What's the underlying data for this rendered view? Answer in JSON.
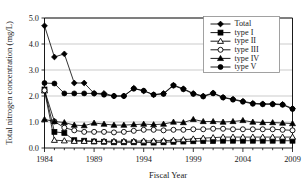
{
  "chart_data": {
    "type": "line",
    "title": "",
    "xlabel": "Fiscal Year",
    "ylabel": "Total nitrogen concentration (mg/L)",
    "xlim": [
      1984,
      2009
    ],
    "ylim": [
      0.0,
      5.0
    ],
    "grid": true,
    "legend_position": "top-right",
    "x": [
      1984,
      1985,
      1986,
      1987,
      1988,
      1989,
      1990,
      1991,
      1992,
      1993,
      1994,
      1995,
      1996,
      1997,
      1998,
      1999,
      2000,
      2001,
      2002,
      2003,
      2004,
      2005,
      2006,
      2007,
      2008,
      2009
    ],
    "xticks": [
      1984,
      1989,
      1994,
      1999,
      2004,
      2009
    ],
    "xtick_labels": [
      "1984",
      "1989",
      "1994",
      "1999",
      "2004",
      "2009"
    ],
    "yticks": [
      0.0,
      1.0,
      2.0,
      3.0,
      4.0,
      5.0
    ],
    "ytick_labels": [
      "0.0",
      "1.0",
      "2.0",
      "3.0",
      "4.0",
      "5.0"
    ],
    "series": [
      {
        "name": "Total",
        "marker": "filled-diamond",
        "values": [
          4.7,
          3.5,
          3.62,
          2.5,
          2.5,
          2.1,
          2.1,
          2.0,
          2.0,
          2.3,
          2.2,
          2.05,
          2.1,
          2.42,
          2.28,
          2.1,
          2.0,
          2.12,
          1.95,
          1.88,
          1.8,
          1.72,
          1.7,
          1.7,
          1.68,
          1.52
        ]
      },
      {
        "name": "type I",
        "marker": "filled-square",
        "values": [
          2.25,
          0.62,
          0.58,
          0.3,
          0.28,
          0.25,
          0.24,
          0.22,
          0.22,
          0.22,
          0.21,
          0.21,
          0.22,
          0.24,
          0.25,
          0.26,
          0.27,
          0.27,
          0.28,
          0.28,
          0.28,
          0.28,
          0.28,
          0.28,
          0.28,
          0.28
        ]
      },
      {
        "name": "type II",
        "marker": "open-triangle",
        "values": [
          2.2,
          0.3,
          0.28,
          0.26,
          0.26,
          0.26,
          0.26,
          0.26,
          0.26,
          0.26,
          0.27,
          0.27,
          0.28,
          0.3,
          0.32,
          0.35,
          0.38,
          0.4,
          0.42,
          0.42,
          0.42,
          0.42,
          0.42,
          0.42,
          0.42,
          0.42
        ]
      },
      {
        "name": "type III",
        "marker": "open-circle",
        "values": [
          2.22,
          1.02,
          0.78,
          0.68,
          0.62,
          0.62,
          0.62,
          0.6,
          0.62,
          0.66,
          0.7,
          0.7,
          0.68,
          0.7,
          0.7,
          0.72,
          0.72,
          0.74,
          0.74,
          0.72,
          0.72,
          0.72,
          0.72,
          0.72,
          0.7,
          0.68
        ]
      },
      {
        "name": "type IV",
        "marker": "filled-triangle",
        "values": [
          1.1,
          1.02,
          0.98,
          0.88,
          0.86,
          0.96,
          0.92,
          0.88,
          0.88,
          0.9,
          0.92,
          0.9,
          0.92,
          1.0,
          0.98,
          1.1,
          1.02,
          1.02,
          1.0,
          1.02,
          1.06,
          1.0,
          0.98,
          0.98,
          0.96,
          0.94
        ]
      },
      {
        "name": "type V",
        "marker": "filled-circle",
        "values": [
          2.5,
          2.48,
          2.1,
          2.1,
          2.1,
          2.1,
          2.05,
          2.0,
          2.0,
          2.28,
          2.2,
          2.05,
          2.08,
          2.4,
          2.26,
          2.08,
          1.98,
          2.1,
          1.94,
          1.86,
          1.78,
          1.7,
          1.68,
          1.68,
          1.66,
          1.5
        ]
      }
    ]
  },
  "legend": {
    "entries": [
      "Total",
      "type I",
      "type II",
      "type III",
      "type IV",
      "type V"
    ]
  },
  "colors": {
    "ink": "#000000",
    "grid": "#b5b5b5",
    "legend_border": "#8a8a8a",
    "background": "#ffffff"
  }
}
